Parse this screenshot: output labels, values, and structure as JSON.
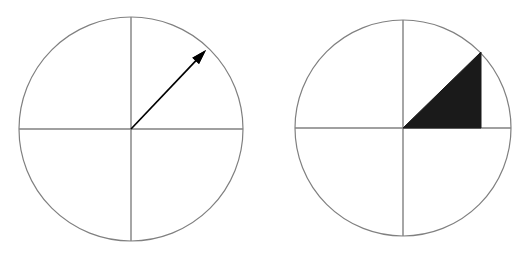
{
  "figure": {
    "background_color": "#ffffff",
    "width": 530,
    "height": 254,
    "stroke_color": "#808080",
    "fill_color": "#1a1a1a"
  },
  "chart_data": {
    "type": "diagram",
    "title": "",
    "xlabel": "",
    "ylabel": "",
    "panels": [
      {
        "name": "terminal-ray-circle",
        "label": "",
        "center": [
          131,
          129
        ],
        "radius": 112,
        "axes": [
          "horizontal",
          "vertical"
        ],
        "marks": [
          {
            "kind": "arrow",
            "from": [
              131,
              129
            ],
            "to": [
              206,
              50
            ],
            "angle_deg": 46.5,
            "quadrant": 1,
            "color": "#000000"
          }
        ]
      },
      {
        "name": "reference-triangle-circle",
        "label": "",
        "center": [
          403,
          128
        ],
        "radius": 108,
        "axes": [
          "horizontal",
          "vertical"
        ],
        "marks": [
          {
            "kind": "filled-right-triangle",
            "vertices": [
              [
                403,
                128
              ],
              [
                481,
                52
              ],
              [
                481,
                128
              ]
            ],
            "angle_deg": 44.3,
            "quadrant": 1,
            "color": "#1a1a1a",
            "right_angle_at": [
              481,
              128
            ]
          }
        ]
      }
    ],
    "legend": [],
    "grid": false
  }
}
